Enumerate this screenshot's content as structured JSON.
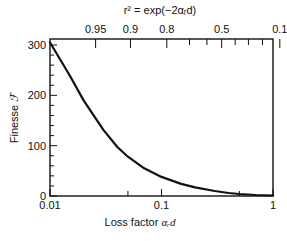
{
  "chart_data": {
    "type": "line",
    "title": "",
    "xlabel": "Loss factor αᵣd",
    "ylabel": "Finesse ℱ",
    "top_xlabel": "r² = exp(−2αᵣd)",
    "xscale": "log",
    "xlim": [
      0.01,
      1
    ],
    "ylim": [
      0,
      300
    ],
    "grid": false,
    "legend": null,
    "x_ticks": [
      {
        "value": 0.01,
        "label": "0.01",
        "major": true
      },
      {
        "value": 0.05,
        "label": "",
        "major": false
      },
      {
        "value": 0.1,
        "label": "0.1",
        "major": true
      },
      {
        "value": 0.5,
        "label": "",
        "major": false
      },
      {
        "value": 1,
        "label": "1",
        "major": true
      }
    ],
    "y_ticks": [
      {
        "value": 0,
        "label": "0"
      },
      {
        "value": 100,
        "label": "100"
      },
      {
        "value": 200,
        "label": "200"
      },
      {
        "value": 300,
        "label": "300"
      }
    ],
    "y_minor_step": 20,
    "top_ticks": [
      {
        "r2": 0.95,
        "label": "0.95",
        "major": true
      },
      {
        "r2": 0.9,
        "label": "0.9",
        "major": true
      },
      {
        "r2": 0.8,
        "label": "0.8",
        "major": true
      },
      {
        "r2": 0.7,
        "label": "",
        "major": false
      },
      {
        "r2": 0.6,
        "label": "",
        "major": false
      },
      {
        "r2": 0.5,
        "label": "0.5",
        "major": true
      },
      {
        "r2": 0.4,
        "label": "",
        "major": false
      },
      {
        "r2": 0.3,
        "label": "",
        "major": false
      },
      {
        "r2": 0.2,
        "label": "",
        "major": false
      },
      {
        "r2": 0.1,
        "label": "0.1",
        "major": true
      }
    ],
    "series": [
      {
        "name": "Finesse",
        "x": [
          0.01,
          0.015,
          0.02,
          0.03,
          0.04,
          0.05,
          0.07,
          0.1,
          0.15,
          0.2,
          0.3,
          0.4,
          0.5,
          0.7,
          1.0
        ],
        "values": [
          305,
          240,
          190,
          132,
          98,
          78,
          55,
          38,
          24,
          17,
          10,
          6,
          4,
          2,
          1
        ]
      }
    ]
  },
  "labels": {
    "xlabel_text": "Loss factor ",
    "xlabel_sym": "αᵣd",
    "ylabel_text": "Finesse ",
    "ylabel_sym": "ℱ",
    "top_label": "r² = exp(−2αᵣd)"
  }
}
